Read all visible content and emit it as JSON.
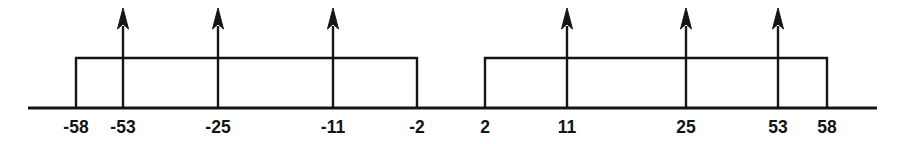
{
  "figure": {
    "title": "",
    "background_color": "#ffffff",
    "ink_color": "#151515",
    "width": 899,
    "height": 144
  },
  "axis": {
    "name": "frequency-axis",
    "y": 108,
    "x_start": 28,
    "x_end": 877,
    "stroke_width": 3
  },
  "chart_data": {
    "type": "line",
    "title": "",
    "xlabel": "",
    "ylabel": "",
    "grid": false,
    "legend": null,
    "axis_tick_labels": [
      "-58",
      "-53",
      "-25",
      "-11",
      "-2",
      "2",
      "11",
      "25",
      "53",
      "58"
    ],
    "axis_tick_values": [
      -58,
      -53,
      -25,
      -11,
      -2,
      2,
      11,
      25,
      53,
      58
    ],
    "axis_tick_pixels": [
      76,
      123,
      218,
      333,
      417,
      485,
      567,
      686,
      778,
      827
    ],
    "rectangles": [
      {
        "name": "negative-passband",
        "label_left": "-58",
        "label_right": "-2",
        "value_left": -58,
        "value_right": -2,
        "x_left_px": 76,
        "x_right_px": 417,
        "top_y_px": 58,
        "baseline_y_px": 108
      },
      {
        "name": "positive-passband",
        "label_left": "2",
        "label_right": "58",
        "value_left": 2,
        "value_right": 58,
        "x_left_px": 485,
        "x_right_px": 827,
        "top_y_px": 58,
        "baseline_y_px": 108
      }
    ],
    "impulses": [
      {
        "name": "impulse-minus-53",
        "label": "-53",
        "value": -53,
        "x_px": 123,
        "tip_y_px": 8,
        "base_y_px": 108
      },
      {
        "name": "impulse-minus-25",
        "label": "-25",
        "value": -25,
        "x_px": 218,
        "tip_y_px": 8,
        "base_y_px": 108
      },
      {
        "name": "impulse-minus-11",
        "label": "-11",
        "value": -11,
        "x_px": 333,
        "tip_y_px": 8,
        "base_y_px": 108
      },
      {
        "name": "impulse-plus-11",
        "label": "11",
        "value": 11,
        "x_px": 567,
        "tip_y_px": 8,
        "base_y_px": 108
      },
      {
        "name": "impulse-plus-25",
        "label": "25",
        "value": 25,
        "x_px": 686,
        "tip_y_px": 8,
        "base_y_px": 108
      },
      {
        "name": "impulse-plus-53",
        "label": "53",
        "value": 53,
        "x_px": 778,
        "tip_y_px": 8,
        "base_y_px": 108
      }
    ],
    "labels": [
      {
        "name": "tick-label-minus-58",
        "text": "-58",
        "x_px": 76,
        "y_px": 133
      },
      {
        "name": "tick-label-minus-53",
        "text": "-53",
        "x_px": 123,
        "y_px": 133
      },
      {
        "name": "tick-label-minus-25",
        "text": "-25",
        "x_px": 218,
        "y_px": 133
      },
      {
        "name": "tick-label-minus-11",
        "text": "-11",
        "x_px": 333,
        "y_px": 133
      },
      {
        "name": "tick-label-minus-2",
        "text": "-2",
        "x_px": 417,
        "y_px": 133
      },
      {
        "name": "tick-label-plus-2",
        "text": "2",
        "x_px": 485,
        "y_px": 133
      },
      {
        "name": "tick-label-plus-11",
        "text": "11",
        "x_px": 567,
        "y_px": 133
      },
      {
        "name": "tick-label-plus-25",
        "text": "25",
        "x_px": 686,
        "y_px": 133
      },
      {
        "name": "tick-label-plus-53",
        "text": "53",
        "x_px": 778,
        "y_px": 133
      },
      {
        "name": "tick-label-plus-58",
        "text": "58",
        "x_px": 827,
        "y_px": 133
      }
    ]
  }
}
